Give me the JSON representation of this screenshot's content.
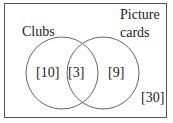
{
  "diagram": {
    "type": "venn",
    "sets": [
      {
        "name": "Clubs",
        "label": "Clubs"
      },
      {
        "name": "Picture cards",
        "label_line1": "Picture",
        "label_line2": "cards"
      }
    ],
    "regions": {
      "clubs_only": "[10]",
      "intersection": "[3]",
      "picture_cards_only": "[9]",
      "outside": "[30]"
    },
    "colors": {
      "stroke": "#555555",
      "text": "#222222",
      "background": "#ffffff"
    }
  }
}
